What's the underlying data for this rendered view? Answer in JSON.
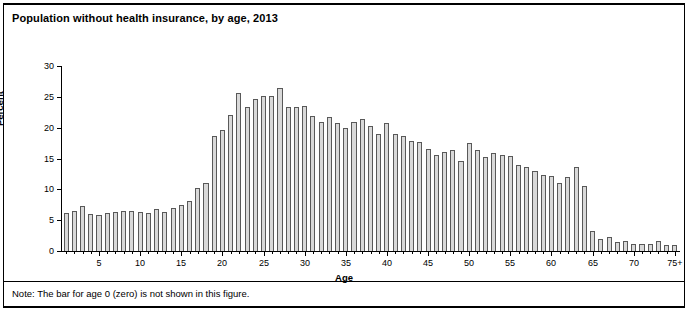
{
  "figure": {
    "title": "Population without health insurance, by age, 2013",
    "note": "Note: The bar for age 0 (zero) is not shown in this figure."
  },
  "chart_data": {
    "type": "bar",
    "title": "Population without health insurance, by age, 2013",
    "xlabel": "Age",
    "ylabel": "Percent",
    "ylim": [
      0,
      30
    ],
    "ytick_values": [
      0,
      5,
      10,
      15,
      20,
      25,
      30
    ],
    "ytick_labels": [
      "0",
      "5",
      "10",
      "15",
      "20",
      "25",
      "30"
    ],
    "xlim": [
      1,
      75
    ],
    "xtick_values": [
      5,
      10,
      15,
      20,
      25,
      30,
      35,
      40,
      45,
      50,
      55,
      60,
      65,
      70,
      75
    ],
    "xtick_labels": [
      "5",
      "10",
      "15",
      "20",
      "25",
      "30",
      "35",
      "40",
      "45",
      "50",
      "55",
      "60",
      "65",
      "70",
      "75+"
    ],
    "grid": false,
    "legend": null,
    "bar_fill_color": "#d9d9d9",
    "bar_edge_color": "#595959",
    "categories": [
      "1",
      "2",
      "3",
      "4",
      "5",
      "6",
      "7",
      "8",
      "9",
      "10",
      "11",
      "12",
      "13",
      "14",
      "15",
      "16",
      "17",
      "18",
      "19",
      "20",
      "21",
      "22",
      "23",
      "24",
      "25",
      "26",
      "27",
      "28",
      "29",
      "30",
      "31",
      "32",
      "33",
      "34",
      "35",
      "36",
      "37",
      "38",
      "39",
      "40",
      "41",
      "42",
      "43",
      "44",
      "45",
      "46",
      "47",
      "48",
      "49",
      "50",
      "51",
      "52",
      "53",
      "54",
      "55",
      "56",
      "57",
      "58",
      "59",
      "60",
      "61",
      "62",
      "63",
      "64",
      "65",
      "66",
      "67",
      "68",
      "69",
      "70",
      "71",
      "72",
      "73",
      "74",
      "75+"
    ],
    "values": [
      6.2,
      6.5,
      7.3,
      6.0,
      5.9,
      6.1,
      6.3,
      6.5,
      6.5,
      6.3,
      6.2,
      6.8,
      6.3,
      7.0,
      7.5,
      8.1,
      10.2,
      11.0,
      18.6,
      19.6,
      22.1,
      25.7,
      23.4,
      24.6,
      25.2,
      25.1,
      26.4,
      23.3,
      23.4,
      23.5,
      21.9,
      20.9,
      21.8,
      20.8,
      19.9,
      20.9,
      21.4,
      20.3,
      18.9,
      20.8,
      19.0,
      18.6,
      17.8,
      17.6,
      16.6,
      15.6,
      16.0,
      16.3,
      14.6,
      17.5,
      16.3,
      15.3,
      15.9,
      15.6,
      15.4,
      14.0,
      13.6,
      13.0,
      12.3,
      12.1,
      11.0,
      12.0,
      13.7,
      10.6,
      3.2,
      1.9,
      2.2,
      1.4,
      1.7,
      1.2,
      1.1,
      1.2,
      1.6,
      1.0,
      0.9
    ]
  }
}
